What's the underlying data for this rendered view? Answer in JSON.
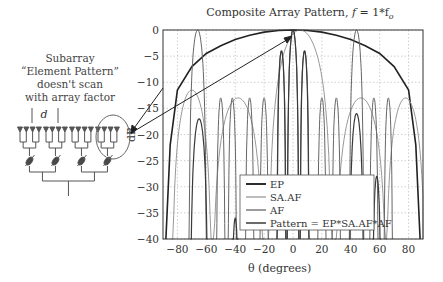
{
  "figure": {
    "title_prefix": "Composite Array Pattern, ",
    "title_var": "f",
    "title_suffix": " = 1*f",
    "title_sub": "o",
    "annotation_lines": [
      "Subarray",
      "“Element Pattern”",
      "doesn't scan",
      "with array factor"
    ],
    "spacing_label": "d"
  },
  "chart_data": {
    "type": "line",
    "title": "Composite Array Pattern, f = 1*fo",
    "xlabel": "θ (degrees)",
    "ylabel": "dB",
    "xlim": [
      -90,
      90
    ],
    "ylim": [
      -40,
      0
    ],
    "xticks": [
      -80,
      -60,
      -40,
      -20,
      0,
      20,
      40,
      60,
      80
    ],
    "yticks": [
      0,
      -5,
      -10,
      -15,
      -20,
      -25,
      -30,
      -35,
      -40
    ],
    "grid": true,
    "legend_position": "lower center-left inside plot",
    "legend": [
      "EP",
      "SA.AF",
      "AF",
      "Pattern = EP*SA.AF*AF"
    ],
    "series": [
      {
        "name": "EP",
        "color": "#222222",
        "width": 1.6,
        "description": "Broad subarray element pattern, peak 0 dB at 0°, ~-11 dB at ±80°, falling to -40 dB near ±87°",
        "x": [
          -88,
          -85,
          -80,
          -70,
          -60,
          -50,
          -40,
          -30,
          -20,
          -10,
          0,
          10,
          20,
          30,
          40,
          50,
          60,
          70,
          80,
          85,
          88
        ],
        "y": [
          -40,
          -22,
          -11.5,
          -7,
          -4.5,
          -3,
          -1.8,
          -1,
          -0.4,
          -0.1,
          0,
          -0.1,
          -0.4,
          -1,
          -1.8,
          -3,
          -4.5,
          -7,
          -11.5,
          -22,
          -40
        ]
      },
      {
        "name": "SA.AF",
        "color": "#999999",
        "width": 1.0,
        "description": "Subarray array factor (wide lobes), main lobe steered near +5°, grating-type lobes",
        "lobes": [
          {
            "center": -70,
            "peak": -11.5,
            "halfwidth": 14
          },
          {
            "center": -38,
            "peak": -13,
            "halfwidth": 18
          },
          {
            "center": 5,
            "peak": 0,
            "halfwidth": 22
          },
          {
            "center": 47,
            "peak": -13,
            "halfwidth": 18
          },
          {
            "center": 78,
            "peak": -13,
            "halfwidth": 14
          }
        ]
      },
      {
        "name": "AF",
        "color": "#666666",
        "width": 1.0,
        "description": "Full array factor: narrow lobes with grating lobes at about -66°, 0°, +44°",
        "lobes": [
          {
            "center": -66,
            "peak": 0,
            "halfwidth": 6
          },
          {
            "center": -50,
            "peak": -13,
            "halfwidth": 3
          },
          {
            "center": -42,
            "peak": -13,
            "halfwidth": 3
          },
          {
            "center": -30,
            "peak": -13,
            "halfwidth": 3
          },
          {
            "center": -20,
            "peak": -13,
            "halfwidth": 3
          },
          {
            "center": -8,
            "peak": -4,
            "halfwidth": 3.2
          },
          {
            "center": 0,
            "peak": 0,
            "halfwidth": 4
          },
          {
            "center": 8,
            "peak": -4,
            "halfwidth": 3.2
          },
          {
            "center": 20,
            "peak": -13,
            "halfwidth": 3
          },
          {
            "center": 30,
            "peak": -13,
            "halfwidth": 3
          },
          {
            "center": 44,
            "peak": 0,
            "halfwidth": 5
          },
          {
            "center": 56,
            "peak": -13,
            "halfwidth": 3
          },
          {
            "center": 66,
            "peak": -13,
            "halfwidth": 3
          }
        ]
      },
      {
        "name": "Pattern = EP*SA.AF*AF",
        "color": "#3a3a3a",
        "width": 1.2,
        "description": "Composite pattern: main beam 0 dB near 0°, reduced grating lobes",
        "lobes": [
          {
            "center": -65,
            "peak": -17,
            "halfwidth": 6
          },
          {
            "center": -40,
            "peak": -36,
            "halfwidth": 2.5
          },
          {
            "center": -8,
            "peak": -4,
            "halfwidth": 3
          },
          {
            "center": 0,
            "peak": 0,
            "halfwidth": 4
          },
          {
            "center": 8,
            "peak": -4,
            "halfwidth": 3
          },
          {
            "center": 44,
            "peak": -16,
            "halfwidth": 5
          },
          {
            "center": 58,
            "peak": -28,
            "halfwidth": 3
          }
        ]
      }
    ]
  }
}
